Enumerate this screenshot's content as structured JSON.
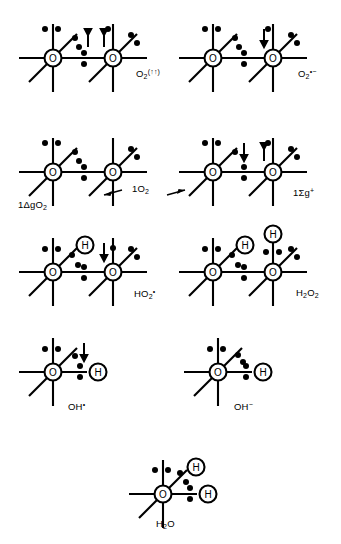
{
  "figure": {
    "ink_color": "#000000",
    "background_color": "#ffffff"
  },
  "chart_data": {
    "type": "diagram",
    "xlabel": "",
    "ylabel": "",
    "grid": false,
    "legend": "none",
    "categories": [
      "O2 (triplet)",
      "O2 radical anion",
      "1ΔgO2",
      "1Σg+",
      "HO2 radical",
      "H2O2",
      "OH radical",
      "OH anion",
      "H2O"
    ],
    "species": [
      {
        "id": "triplet-oxygen",
        "label_text": "O2(↑↑)",
        "atoms": 2,
        "hydrogens": 0,
        "unpaired_spins": 2,
        "row": 1,
        "column": 1
      },
      {
        "id": "superoxide",
        "label_text": "O2•−",
        "atoms": 2,
        "hydrogens": 0,
        "unpaired_spins": 1,
        "row": 1,
        "column": 2
      },
      {
        "id": "singlet-delta-g",
        "label_text": "1ΔgO2",
        "atoms": 2,
        "hydrogens": 0,
        "unpaired_spins": 0,
        "row": 2,
        "column": 1
      },
      {
        "id": "singlet-sigma-g-plus",
        "label_text": "1Σg+",
        "atoms": 2,
        "hydrogens": 0,
        "unpaired_spins": 2,
        "row": 2,
        "column": 2
      },
      {
        "id": "hydroperoxyl",
        "label_text": "HO2•",
        "atoms": 2,
        "hydrogens": 1,
        "unpaired_spins": 1,
        "row": 3,
        "column": 1
      },
      {
        "id": "hydrogen-peroxide",
        "label_text": "H2O2",
        "atoms": 2,
        "hydrogens": 2,
        "unpaired_spins": 0,
        "row": 3,
        "column": 2
      },
      {
        "id": "hydroxyl-radical",
        "label_text": "OH•",
        "atoms": 1,
        "hydrogens": 1,
        "unpaired_spins": 1,
        "row": 4,
        "column": 1
      },
      {
        "id": "hydroxide",
        "label_text": "OH−",
        "atoms": 1,
        "hydrogens": 1,
        "unpaired_spins": 0,
        "row": 4,
        "column": 2
      },
      {
        "id": "water",
        "label_text": "H2O",
        "atoms": 1,
        "hydrogens": 2,
        "unpaired_spins": 0,
        "row": 5,
        "column": 1
      }
    ],
    "annotations": [
      {
        "id": "singlet-oxygen-callout",
        "text": "1O2",
        "note": "central label with arrows pointing to it from the 1ΔgO2 and 1Σg+ structures"
      }
    ]
  },
  "labels": {
    "triplet_oxygen": {
      "base": "O",
      "sub": "2",
      "sup": "(↑↑)"
    },
    "superoxide": {
      "base": "O",
      "sub": "2",
      "sup": "•−"
    },
    "singlet_delta": {
      "text": "1ΔgO",
      "sub": "2"
    },
    "singlet_oxygen": {
      "text": "1O",
      "sub": "2"
    },
    "singlet_sigma": {
      "text": "1Σg",
      "sup": "+"
    },
    "hydroperoxyl": {
      "base": "HO",
      "sub": "2",
      "sup": "•"
    },
    "hydrogen_peroxide": {
      "base": "H",
      "sub1": "2",
      "mid": "O",
      "sub2": "2"
    },
    "hydroxyl_radical": {
      "base": "OH",
      "sup": "•"
    },
    "hydroxide": {
      "base": "OH",
      "sup": "−"
    },
    "water": {
      "base": "H",
      "sub": "2",
      "mid": "O"
    }
  },
  "atom_glyphs": {
    "oxygen": "O",
    "hydrogen": "H"
  }
}
